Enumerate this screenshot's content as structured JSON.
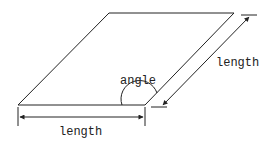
{
  "diagram": {
    "labels": {
      "angle": "angle",
      "bottom_length": "length",
      "side_length": "length"
    },
    "colors": {
      "stroke": "#222222",
      "background": "#ffffff"
    }
  }
}
